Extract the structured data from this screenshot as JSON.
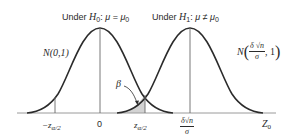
{
  "title_h0": {
    "prefix": "Under ",
    "hyp": "H",
    "hyp_sub": "0",
    "colon": ":",
    "lhs": "μ",
    "op": "=",
    "rhs": "μ",
    "rhs_sub": "0"
  },
  "title_h1": {
    "prefix": "Under ",
    "hyp": "H",
    "hyp_sub": "1",
    "colon": ":",
    "lhs": "μ",
    "op": "≠",
    "rhs": "μ",
    "rhs_sub": "0"
  },
  "dist_h0": {
    "label": "N(0,1)"
  },
  "dist_h1": {
    "prefix": "N",
    "open": "(",
    "num": "δ √n",
    "den": "σ",
    "rest": ", 1",
    "close": ")"
  },
  "beta_label": "β",
  "axis": {
    "ticks": [
      {
        "main": "−z",
        "sub": "α/2"
      },
      {
        "main": "0"
      },
      {
        "main": "z",
        "sub": "α/2"
      },
      {
        "num": "δ√n",
        "den": "σ"
      }
    ],
    "axis_label": {
      "main": "Z",
      "sub": "0"
    }
  },
  "colors": {
    "curve": "#2b2b2b",
    "axis": "#9a9a9a",
    "guide": "#6a6a6a",
    "shade": "#d3d3d3"
  }
}
